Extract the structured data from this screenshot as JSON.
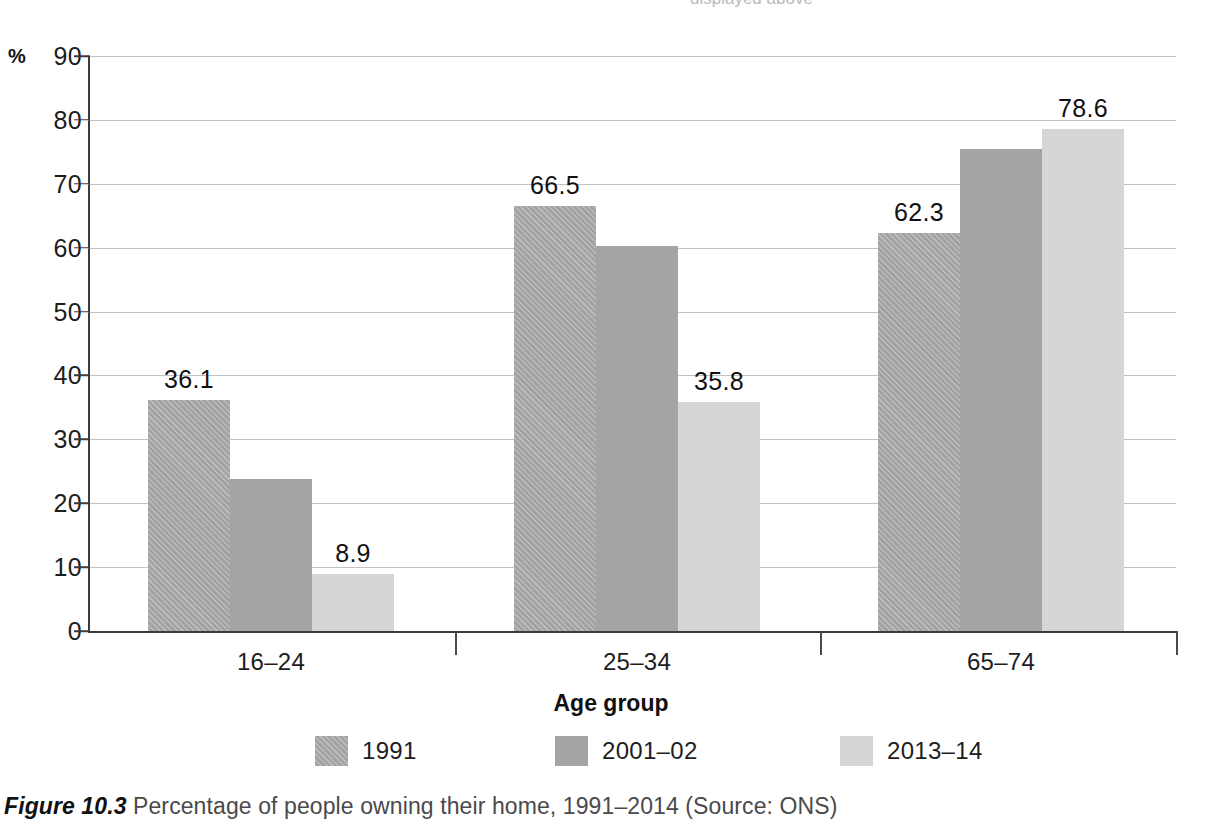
{
  "top_clipped_text": "displayed above",
  "axis": {
    "y_unit_label": "%",
    "y_ticks": [
      "90",
      "80",
      "70",
      "60",
      "50",
      "40",
      "30",
      "20",
      "10",
      "0"
    ],
    "x_title": "Age group"
  },
  "caption": {
    "figure_label": "Figure 10.3",
    "text": " Percentage of people owning their home, 1991–2014 (Source: ONS)"
  },
  "legend": {
    "items": [
      {
        "label": "1991",
        "color": "#a9a9a9",
        "pattern": "diagonal-hatch"
      },
      {
        "label": "2001–02",
        "color": "#a4a4a4",
        "pattern": "solid"
      },
      {
        "label": "2013–14",
        "color": "#d6d6d6",
        "pattern": "solid"
      }
    ]
  },
  "chart_data": {
    "type": "bar",
    "title": "Percentage of people owning their home, 1991–2014",
    "xlabel": "Age group",
    "ylabel": "%",
    "ylim": [
      0,
      90
    ],
    "ytick_step": 10,
    "grid": true,
    "legend_position": "bottom",
    "source": "ONS",
    "categories": [
      "16–24",
      "25–34",
      "65–74"
    ],
    "series": [
      {
        "name": "1991",
        "color": "#a9a9a9",
        "values": [
          36.1,
          66.5,
          62.3
        ],
        "labels": [
          "36.1",
          "66.5",
          "62.3"
        ]
      },
      {
        "name": "2001–02",
        "color": "#a4a4a4",
        "values": [
          23.8,
          60.2,
          75.5
        ],
        "labels": [
          "",
          "",
          ""
        ]
      },
      {
        "name": "2013–14",
        "color": "#d6d6d6",
        "values": [
          8.9,
          35.8,
          78.6
        ],
        "labels": [
          "8.9",
          "35.8",
          "78.6"
        ]
      }
    ]
  }
}
